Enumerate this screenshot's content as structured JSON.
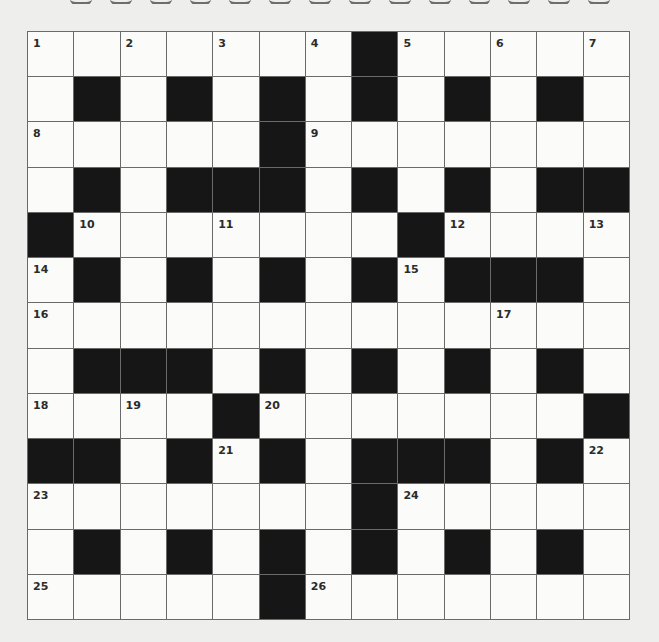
{
  "puzzle": {
    "type": "crossword",
    "rows": 13,
    "cols": 13,
    "colors": {
      "background": "#eeeeec",
      "white_cell": "#fbfbf9",
      "black_cell": "#161616",
      "grid_line": "#6a6a6a"
    },
    "grid": [
      "1.2.3.4#5.6.7",
      ".#.#.#.#.#.#.",
      "8....#9......",
      ".#.###.#.#.##",
      "#10..11..#12..13",
      "14#.#.#.#15###.",
      "16.........17..",
      ".###.#.#.#.#.",
      "18.19.#20......#",
      "##.#21#.###.#22",
      "23......#24....",
      ".#.#.#.#.#.#.",
      "25....#26......"
    ],
    "layout": [
      [
        "W",
        "W",
        "W",
        "W",
        "W",
        "W",
        "W",
        "B",
        "W",
        "W",
        "W",
        "W",
        "W"
      ],
      [
        "W",
        "B",
        "W",
        "B",
        "W",
        "B",
        "W",
        "B",
        "W",
        "B",
        "W",
        "B",
        "W"
      ],
      [
        "W",
        "W",
        "W",
        "W",
        "W",
        "B",
        "W",
        "W",
        "W",
        "W",
        "W",
        "W",
        "W"
      ],
      [
        "W",
        "B",
        "W",
        "B",
        "B",
        "B",
        "W",
        "B",
        "W",
        "B",
        "W",
        "B",
        "B"
      ],
      [
        "B",
        "W",
        "W",
        "W",
        "W",
        "W",
        "W",
        "W",
        "B",
        "W",
        "W",
        "W",
        "W"
      ],
      [
        "W",
        "B",
        "W",
        "B",
        "W",
        "B",
        "W",
        "B",
        "W",
        "B",
        "B",
        "B",
        "W"
      ],
      [
        "W",
        "W",
        "W",
        "W",
        "W",
        "W",
        "W",
        "W",
        "W",
        "W",
        "W",
        "W",
        "W"
      ],
      [
        "W",
        "B",
        "B",
        "B",
        "W",
        "B",
        "W",
        "B",
        "W",
        "B",
        "W",
        "B",
        "W"
      ],
      [
        "W",
        "W",
        "W",
        "W",
        "B",
        "W",
        "W",
        "W",
        "W",
        "W",
        "W",
        "W",
        "B"
      ],
      [
        "B",
        "B",
        "W",
        "B",
        "W",
        "B",
        "W",
        "B",
        "B",
        "B",
        "W",
        "B",
        "W"
      ],
      [
        "W",
        "W",
        "W",
        "W",
        "W",
        "W",
        "W",
        "B",
        "W",
        "W",
        "W",
        "W",
        "W"
      ],
      [
        "W",
        "B",
        "W",
        "B",
        "W",
        "B",
        "W",
        "B",
        "W",
        "B",
        "W",
        "B",
        "W"
      ],
      [
        "W",
        "W",
        "W",
        "W",
        "W",
        "B",
        "W",
        "W",
        "W",
        "W",
        "W",
        "W",
        "W"
      ]
    ],
    "numbers": [
      {
        "n": "1",
        "row": 0,
        "col": 0
      },
      {
        "n": "2",
        "row": 0,
        "col": 2
      },
      {
        "n": "3",
        "row": 0,
        "col": 4
      },
      {
        "n": "4",
        "row": 0,
        "col": 6
      },
      {
        "n": "5",
        "row": 0,
        "col": 8
      },
      {
        "n": "6",
        "row": 0,
        "col": 10
      },
      {
        "n": "7",
        "row": 0,
        "col": 12
      },
      {
        "n": "8",
        "row": 2,
        "col": 0
      },
      {
        "n": "9",
        "row": 2,
        "col": 6
      },
      {
        "n": "10",
        "row": 4,
        "col": 1
      },
      {
        "n": "11",
        "row": 4,
        "col": 4
      },
      {
        "n": "12",
        "row": 4,
        "col": 9
      },
      {
        "n": "13",
        "row": 4,
        "col": 12
      },
      {
        "n": "14",
        "row": 5,
        "col": 0
      },
      {
        "n": "15",
        "row": 5,
        "col": 8
      },
      {
        "n": "16",
        "row": 6,
        "col": 0
      },
      {
        "n": "17",
        "row": 6,
        "col": 10
      },
      {
        "n": "18",
        "row": 8,
        "col": 0
      },
      {
        "n": "19",
        "row": 8,
        "col": 2
      },
      {
        "n": "20",
        "row": 8,
        "col": 5
      },
      {
        "n": "21",
        "row": 9,
        "col": 4
      },
      {
        "n": "22",
        "row": 9,
        "col": 12
      },
      {
        "n": "23",
        "row": 10,
        "col": 0
      },
      {
        "n": "24",
        "row": 10,
        "col": 8
      },
      {
        "n": "25",
        "row": 12,
        "col": 0
      },
      {
        "n": "26",
        "row": 12,
        "col": 6
      }
    ]
  }
}
